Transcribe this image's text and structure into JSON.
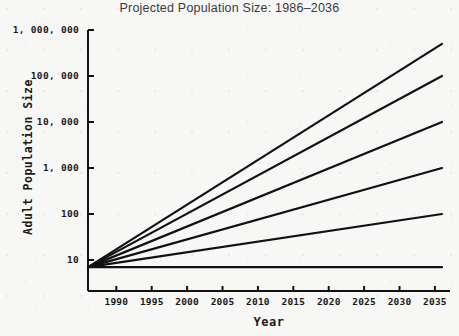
{
  "chart_data": {
    "type": "line",
    "title": "Projected Population Size: 1986–2036",
    "xlabel": "Year",
    "ylabel": "Adult Population Size",
    "xlim": [
      1985.5,
      2036.5
    ],
    "ylim": [
      5,
      1000000
    ],
    "yscale": "log",
    "grid": false,
    "legend": "none",
    "xticks": [
      1990,
      1995,
      2000,
      2005,
      2010,
      2015,
      2020,
      2025,
      2030,
      2035
    ],
    "xtick_labels": [
      "1990",
      "1995",
      "2000",
      "2005",
      "2010",
      "2015",
      "2020",
      "2025",
      "2030",
      "2035"
    ],
    "yticks": [
      10,
      100,
      1000,
      10000,
      100000,
      1000000
    ],
    "ytick_labels": [
      "10",
      "100",
      "1,000",
      "10,000",
      "100,000",
      "1,000,000"
    ],
    "x_start": 1986,
    "x_end": 2036,
    "y_start": 7,
    "series": [
      {
        "name": "growth-rate-1",
        "start_year": 1986,
        "end_year": 2036,
        "start_value": 7,
        "end_value": 500000
      },
      {
        "name": "growth-rate-2",
        "start_year": 1986,
        "end_year": 2036,
        "start_value": 7,
        "end_value": 100000
      },
      {
        "name": "growth-rate-3",
        "start_year": 1986,
        "end_year": 2036,
        "start_value": 7,
        "end_value": 10000
      },
      {
        "name": "growth-rate-4",
        "start_year": 1986,
        "end_year": 2036,
        "start_value": 7,
        "end_value": 1000
      },
      {
        "name": "growth-rate-5",
        "start_year": 1986,
        "end_year": 2036,
        "start_value": 7,
        "end_value": 100
      },
      {
        "name": "growth-rate-6",
        "start_year": 1986,
        "end_year": 2036,
        "start_value": 7,
        "end_value": 7
      }
    ],
    "line_color": "#111111",
    "background_color": "#f7f7f5"
  }
}
